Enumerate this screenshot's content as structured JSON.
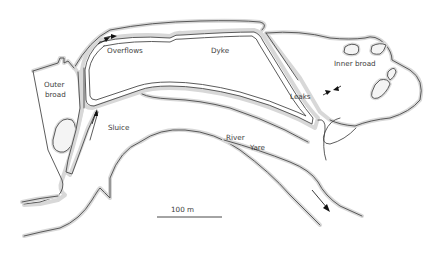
{
  "diagram": {
    "type": "site-map",
    "labels": {
      "overflows": "Overflows",
      "dyke": "Dyke",
      "outer_broad_line1": "Outer",
      "outer_broad_line2": "broad",
      "inner_broad": "Inner broad",
      "leaks": "Leaks",
      "sluice": "Sluice",
      "river_line1": "River",
      "river_line2": "Yare",
      "scale": "100 m"
    },
    "features": [
      {
        "name": "Dyke",
        "kind": "embankment"
      },
      {
        "name": "Overflows",
        "kind": "arrow-marker",
        "count": 2
      },
      {
        "name": "Sluice",
        "kind": "arrow-marker",
        "count": 1
      },
      {
        "name": "Leaks",
        "kind": "arrow-marker",
        "count": 2
      },
      {
        "name": "Outer broad",
        "kind": "water-body"
      },
      {
        "name": "Inner broad",
        "kind": "water-body"
      },
      {
        "name": "River Yare",
        "kind": "river",
        "flow_direction": "south-east"
      }
    ],
    "scale_bar": {
      "length_label": "100 m"
    },
    "colors": {
      "line": "#4a4a4a",
      "shore_stipple": "#d8d8d8",
      "background": "#ffffff"
    }
  }
}
